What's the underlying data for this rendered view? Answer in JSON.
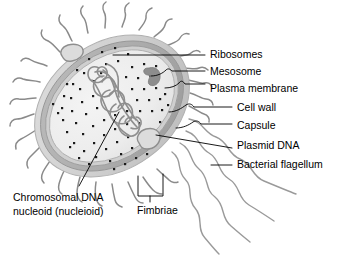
{
  "figure": {
    "background_color": "#ffffff"
  },
  "colors": {
    "capsule": "#d2d2d2",
    "cell_wall": "#a8a8a8",
    "plasma_membrane": "#c8c8c8",
    "cytoplasm": "#eeeeee",
    "nucleoid": "#8e8e8e",
    "mesosome": "#8a8a8a",
    "ribosome": "#1a1a1a",
    "appendage": "#8a8a8a",
    "leader_line": "#000000",
    "label_text": "#000000"
  },
  "labels": {
    "right": [
      {
        "id": "ribosomes",
        "text": "Ribosomes"
      },
      {
        "id": "mesosome",
        "text": "Mesosome"
      },
      {
        "id": "plasma-membrane",
        "text": "Plasma membrane"
      },
      {
        "id": "cell-wall",
        "text": "Cell wall"
      },
      {
        "id": "capsule",
        "text": "Capsule"
      },
      {
        "id": "plasmid-dna",
        "text": "Plasmid DNA"
      },
      {
        "id": "bacterial-flagellum",
        "text": "Bacterial flagellum"
      }
    ],
    "bottom_left": {
      "id": "chromosomal-dna",
      "line1": "Chromosomal DNA",
      "line2": "nucleoid (nucleioid)"
    },
    "bottom_center": {
      "id": "fimbriae",
      "text": "Fimbriae"
    }
  },
  "structures": {
    "cell": {
      "name": "bacterial-cell-body",
      "shape": "tilted-ellipse"
    },
    "nucleoid": {
      "name": "chromosomal-dna-nucleoid",
      "description": "tangled looped DNA strand in cell center"
    },
    "mesosome": {
      "name": "mesosome",
      "description": "dark infolded membrane blob, upper right interior"
    },
    "plasmids": [
      {
        "name": "plasmid-loop-upper-left"
      },
      {
        "name": "plasmid-loop-lower-right"
      }
    ],
    "ribosomes": {
      "name": "ribosome-dots",
      "count": 74
    },
    "fimbriae": {
      "name": "fimbriae-pili",
      "count": 24
    },
    "flagella": {
      "name": "bacterial-flagella",
      "count": 4
    }
  }
}
